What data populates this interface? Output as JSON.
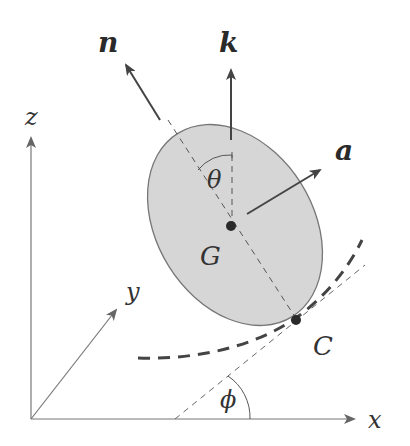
{
  "diagram": {
    "type": "rigid-body-on-curve",
    "colors": {
      "body_fill": "#d6d6d6",
      "body_stroke": "#777777",
      "lines": "#555555",
      "text": "#333333",
      "background": "#ffffff"
    },
    "axes": {
      "x_label": "x",
      "y_label": "y",
      "z_label": "z"
    },
    "vectors": {
      "n_label": "n",
      "k_label": "k",
      "a_label": "a"
    },
    "points": {
      "center_label": "G",
      "contact_label": "C"
    },
    "angles": {
      "theta_label": "θ",
      "phi_label": "ϕ"
    }
  }
}
